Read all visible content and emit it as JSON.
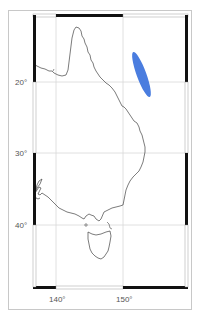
{
  "map": {
    "region": "Eastern Australia",
    "colors": {
      "frame_black": "#111111",
      "frame_white": "#ffffff",
      "gridline": "#d8d8d8",
      "coastline": "#444444",
      "outer_border": "#c8c8c8",
      "highlight": "#4a7ddf"
    },
    "latitude_labels": [
      {
        "value": "20°",
        "lat": -20
      },
      {
        "value": "30°",
        "lat": -30
      },
      {
        "value": "40°",
        "lat": -40
      }
    ],
    "longitude_labels": [
      {
        "value": "140°",
        "lon": 140
      },
      {
        "value": "150°",
        "lon": 150
      }
    ],
    "highlight_feature": {
      "shape": "elongated ellipse",
      "description": "Blue elongated region offshore, northeast of Queensland coast",
      "approx_lon_range": [
        151.2,
        154.0
      ],
      "approx_lat_range": [
        -15.0,
        -22.0
      ]
    }
  }
}
